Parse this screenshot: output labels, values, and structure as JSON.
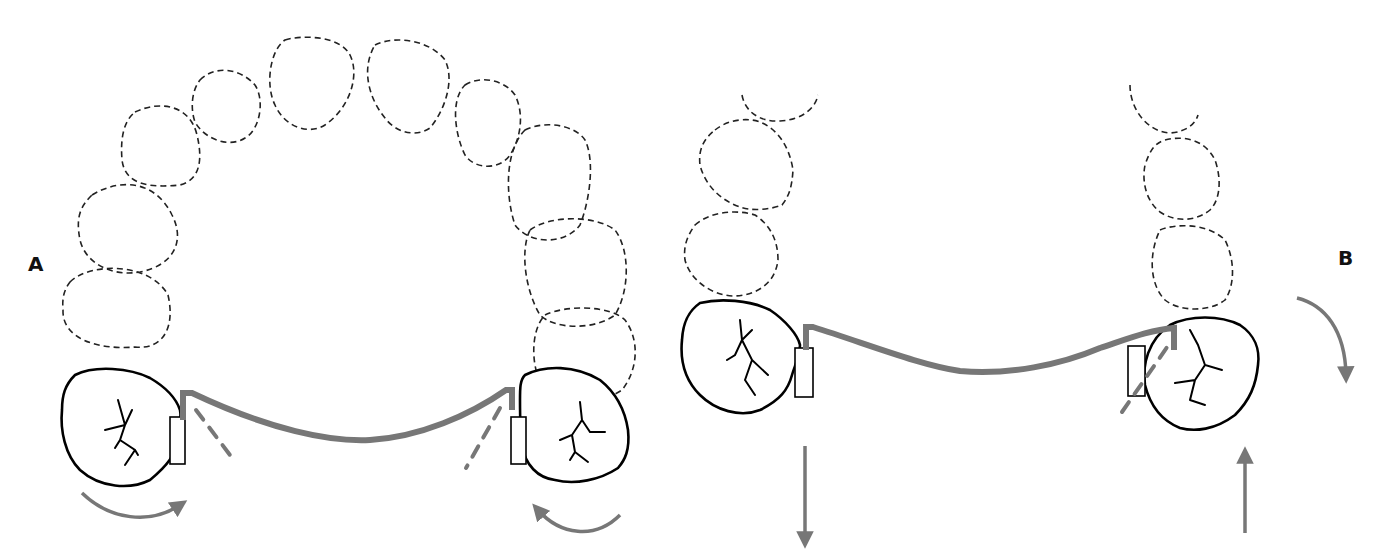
{
  "figure": {
    "type": "dental arch diagram",
    "panels": [
      {
        "label": "A",
        "description": "Full maxillary arch (occlusal view) with transpalatal arch connecting first molars; curved arrows indicate molar rotation",
        "dashed_teeth_count": 12,
        "molars": 2,
        "arrows": [
          "clockwise-rotation-left",
          "counterclockwise-rotation-right"
        ]
      },
      {
        "label": "B",
        "description": "Posterior segments with transpalatal arch; vertical arrows and curved arrow indicate tipping/torque forces",
        "dashed_teeth_count": 6,
        "molars": 2,
        "arrows": [
          "down-left",
          "up-right",
          "curved-down-right"
        ]
      }
    ]
  },
  "colors": {
    "wire": "#777777",
    "outline": "#000000",
    "dashed": "#222222",
    "background": "#ffffff"
  }
}
